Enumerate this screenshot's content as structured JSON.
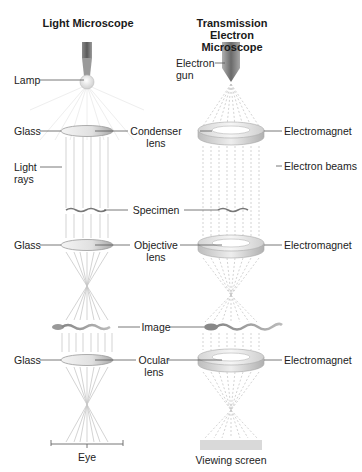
{
  "titles": {
    "light": "Light Microscope",
    "tem_line1": "Transmission Electron",
    "tem_line2": "Microscope"
  },
  "light_labels": {
    "lamp": "Lamp",
    "glass_1": "Glass",
    "light_rays_1": "Light",
    "light_rays_2": "rays",
    "glass_2": "Glass",
    "glass_3": "Glass",
    "eye": "Eye"
  },
  "center_labels": {
    "condenser_1": "Condenser",
    "condenser_2": "lens",
    "specimen": "Specimen",
    "objective_1": "Objective",
    "objective_2": "lens",
    "image": "Image",
    "ocular_1": "Ocular",
    "ocular_2": "lens"
  },
  "tem_labels": {
    "electron_gun_1": "Electron",
    "electron_gun_2": "gun",
    "electromagnet_1": "Electromagnet",
    "electron_beams": "Electron beams",
    "electromagnet_2": "Electromagnet",
    "electromagnet_3": "Electromagnet",
    "viewing_screen": "Viewing screen"
  },
  "colors": {
    "text": "#222222",
    "leader_line": "#555555",
    "ray": "#c8c8c8",
    "ring": "#d8d8d8",
    "screen": "#d9d9d9"
  }
}
